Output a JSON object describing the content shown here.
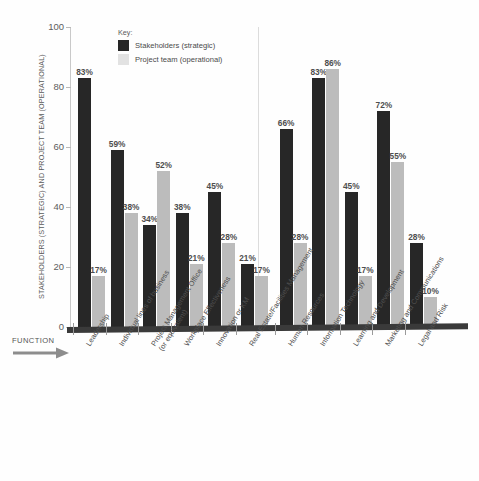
{
  "chart_data": {
    "type": "bar",
    "title": "",
    "xlabel": "FUNCTION",
    "ylabel": "STAKEHOLDERS (STRATEGIC) AND PROJECT TEAM (OPERATIONAL)",
    "ylim": [
      0,
      100
    ],
    "yticks": [
      0,
      20,
      40,
      60,
      80,
      100
    ],
    "grid": false,
    "legend_position": "top-center",
    "legend_title": "Key:",
    "categories": [
      "Leadership",
      "Individual lines of business",
      "Project Management Office (or equivalent)",
      "Workplace Effectiveness",
      "Innovation or KM",
      "Real Estate/Facilities Management",
      "Human Resources",
      "Information Technology",
      "Learning and Development",
      "Marketing and Communications",
      "Legal and Risk"
    ],
    "category_lines": [
      [
        "Leadership"
      ],
      [
        "Individual lines of business"
      ],
      [
        "Project Management Office",
        "(or equivalent)"
      ],
      [
        "Workplace Effectiveness"
      ],
      [
        "Innovation or KM"
      ],
      [
        "Real Estate/Facilities Management"
      ],
      [
        "Human Resources"
      ],
      [
        "Information Technology"
      ],
      [
        "Learning and Development"
      ],
      [
        "Marketing and Communications"
      ],
      [
        "Legal and Risk"
      ]
    ],
    "series": [
      {
        "name": "Stakeholders (strategic)",
        "color": "#272727",
        "values": [
          83,
          59,
          34,
          38,
          45,
          21,
          66,
          83,
          45,
          72,
          28
        ],
        "labels": [
          "83%",
          "59%",
          "34%",
          "38%",
          "45%",
          "21%",
          "66%",
          "83%",
          "45%",
          "72%",
          "28%"
        ]
      },
      {
        "name": "Project team (operational)",
        "color": "#bcbcbc",
        "values": [
          17,
          38,
          52,
          21,
          28,
          17,
          28,
          86,
          17,
          55,
          10
        ],
        "labels": [
          "17%",
          "38%",
          "52%",
          "21%",
          "28%",
          "17%",
          "28%",
          "86%",
          "17%",
          "55%",
          "10%"
        ]
      }
    ]
  },
  "legend": {
    "title": "Key:",
    "items": [
      {
        "label": "Stakeholders (strategic)",
        "swatch": "dark"
      },
      {
        "label": "Project team (operational)",
        "swatch": "light"
      }
    ]
  },
  "axis": {
    "y_title": "STAKEHOLDERS (STRATEGIC) AND PROJECT TEAM (OPERATIONAL)",
    "x_title": "FUNCTION",
    "y_ticks": [
      "100",
      "80",
      "60",
      "40",
      "20",
      "0"
    ]
  },
  "colors": {
    "series_dark": "#272727",
    "series_light": "#bcbcbc",
    "axis": "#c9c9c9",
    "baseline": "#3a3a3a",
    "text": "#4f4f4f"
  }
}
